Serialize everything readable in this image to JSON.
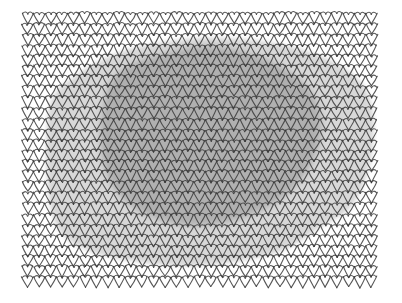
{
  "image": {
    "title": "Knitted stockinette fabric swatch with cast shadow",
    "width": 402,
    "height": 303,
    "background_color": "#ffffff",
    "medium": "pen-and-ink line drawing with gray wash shading"
  },
  "fabric": {
    "name": "stockinette-knit-swatch",
    "stitch_type": "stockinette / knit V-stitch",
    "columns": 31,
    "rows": 26,
    "stitch_width_px": 11.4,
    "stitch_height_px": 10.5,
    "bounds": {
      "x": 22,
      "y": 13,
      "width": 355,
      "height": 275
    },
    "line_color": "#3a3a3a",
    "line_width_px": 1.1,
    "yarn_fill_color": "#fdfdfd",
    "edge_style": "scalloped top and bottom, ragged side selvedges"
  },
  "shading": {
    "light_shadow": {
      "name": "outer-shadow-blob",
      "color": "#b9b9b9",
      "opacity": 0.55,
      "description": "large irregular polygon covering most of the swatch, stepped edges following stitch columns"
    },
    "dark_shadow": {
      "name": "inner-shadow-blob",
      "color": "#8a8a8a",
      "opacity": 0.5,
      "description": "darker rounded blob over the upper-centre of the swatch"
    },
    "highlight": {
      "name": "unshaded-fabric",
      "color": "#ffffff",
      "description": "white un-shaded knit at top-left, top-right, bottom-left and bottom-right corners"
    }
  },
  "chart_data": {
    "type": "heatmap",
    "xlabel": "stitch column",
    "ylabel": "stitch row",
    "categories": [
      "unshaded",
      "light-shadow",
      "dark-shadow"
    ],
    "values": [
      0,
      1,
      2
    ],
    "grid": false,
    "legend": "none",
    "columns": 31,
    "rows": 26,
    "light_shadow_polygon": [
      [
        0.08,
        0.33
      ],
      [
        0.07,
        0.6
      ],
      [
        0.1,
        0.78
      ],
      [
        0.18,
        0.86
      ],
      [
        0.3,
        0.9
      ],
      [
        0.46,
        0.92
      ],
      [
        0.62,
        0.9
      ],
      [
        0.74,
        0.86
      ],
      [
        0.84,
        0.78
      ],
      [
        0.93,
        0.7
      ],
      [
        0.98,
        0.55
      ],
      [
        0.99,
        0.38
      ],
      [
        0.96,
        0.26
      ],
      [
        0.88,
        0.18
      ],
      [
        0.78,
        0.13
      ],
      [
        0.66,
        0.1
      ],
      [
        0.52,
        0.09
      ],
      [
        0.38,
        0.11
      ],
      [
        0.26,
        0.15
      ],
      [
        0.16,
        0.22
      ]
    ],
    "dark_shadow_polygon": [
      [
        0.24,
        0.28
      ],
      [
        0.22,
        0.46
      ],
      [
        0.25,
        0.62
      ],
      [
        0.33,
        0.72
      ],
      [
        0.45,
        0.77
      ],
      [
        0.58,
        0.76
      ],
      [
        0.7,
        0.7
      ],
      [
        0.79,
        0.6
      ],
      [
        0.84,
        0.46
      ],
      [
        0.83,
        0.32
      ],
      [
        0.76,
        0.22
      ],
      [
        0.65,
        0.15
      ],
      [
        0.52,
        0.12
      ],
      [
        0.39,
        0.15
      ],
      [
        0.29,
        0.2
      ]
    ]
  }
}
